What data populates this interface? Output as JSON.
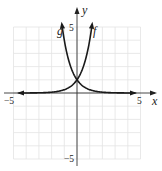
{
  "chart_data": {
    "type": "line",
    "title": "",
    "xlabel": "x",
    "ylabel": "y",
    "xlim": [
      -5,
      5
    ],
    "ylim": [
      -5,
      5
    ],
    "grid": true,
    "x_ticks_labeled": [
      "-5",
      "5"
    ],
    "y_ticks_labeled": [
      "5",
      "-5"
    ],
    "series": [
      {
        "name": "f",
        "expression": "a^x (increasing exponential, a≈4)",
        "x": [
          -5,
          -3,
          -2,
          -1,
          0,
          0.5,
          1,
          1.16
        ],
        "values": [
          0.001,
          0.016,
          0.06,
          0.25,
          1,
          2,
          4,
          5
        ]
      },
      {
        "name": "g",
        "expression": "a^(-x) (decreasing exponential, a≈4)",
        "x": [
          -1.16,
          -1,
          -0.5,
          0,
          1,
          2,
          3,
          5
        ],
        "values": [
          5,
          4,
          2,
          1,
          0.25,
          0.06,
          0.016,
          0.001
        ]
      }
    ],
    "annotations": [
      "curves intersect at (0, 1)"
    ]
  },
  "labels": {
    "x_axis": "x",
    "y_axis": "y",
    "x_min": "−5",
    "x_max": "5",
    "y_max": "5",
    "y_min": "−5",
    "f": "f",
    "g": "g"
  },
  "colors": {
    "grid": "#e2e2e2",
    "axis": "#333333",
    "curve": "#1a1a1a"
  }
}
